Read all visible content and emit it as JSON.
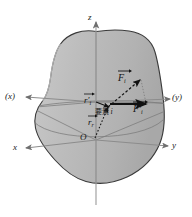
{
  "figure": {
    "background_color": "#ffffff",
    "body_fill_color": "#b9b9b9",
    "body_stroke_color": "#3a3a3a",
    "axis_color": "#8c8c8c",
    "vector_color": "#111111",
    "labels": {
      "axis_z": "z",
      "axis_x_primed": "(x)",
      "axis_y_primed": "(y)",
      "axis_x": "x",
      "axis_y": "y",
      "origin": "O",
      "force_i": "F",
      "force_i_sub": "i",
      "force_i_primed": "F",
      "force_i_primed_sub": "i",
      "force_i_primed_mark": "'",
      "radius_primed": "r",
      "radius_primed_sub": "i",
      "radius_primed_mark": "'",
      "radius_i": "r",
      "radius_i_sub": "i",
      "element_label": "要素",
      "element_index": "i"
    },
    "icons": {
      "vector_arrow": "vector-arrow-overbar",
      "dashed_arrow": "dashed-arrow-icon",
      "solid_arrow": "solid-arrow-icon",
      "axis_arrow": "axis-arrowhead-icon"
    }
  }
}
